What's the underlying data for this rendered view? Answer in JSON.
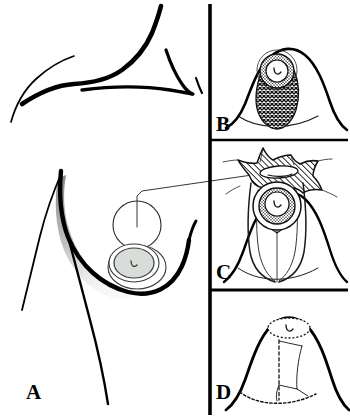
{
  "figure": {
    "kind": "medical-surgical-illustration",
    "background_color": "#ffffff",
    "ink_color": "#000000",
    "width_px": 350,
    "height_px": 419
  },
  "panels": [
    {
      "id": "A",
      "label": "A",
      "name": "panel-a-torso-overview",
      "description": "Anterior torso line drawing showing shoulder, neck, clavicle, sternal notch, breast contour with shading, tumor location circle and nipple-areola complex",
      "elements": [
        "shoulder-contour",
        "neck-contour",
        "clavicle-line",
        "sternal-notch",
        "breast-contour-shadow",
        "tumor-circle",
        "leader-line",
        "nipple-areola-complex"
      ]
    },
    {
      "id": "B",
      "label": "B",
      "name": "panel-b-resection-marking",
      "description": "Frontal breast mound with cross-hatched teardrop resection field extending from areola to inframammary fold",
      "elements": [
        "breast-mound-outline",
        "inframammary-fold",
        "crosshatch-resection-area",
        "stippled-areola-ring",
        "nipple-mark"
      ]
    },
    {
      "id": "C",
      "label": "C",
      "name": "panel-c-tissue-mobilization",
      "description": "Breast mound with diagonally hatched superior tissue flap, specimen lens, radiating mobilization lines and converging inferior pillars",
      "elements": [
        "breast-mound-outline",
        "inframammary-fold",
        "diagonal-hatch-flap",
        "specimen-lens",
        "radiating-lines",
        "stippled-areola-ring",
        "nipple-mark",
        "converging-pillar-lines"
      ]
    },
    {
      "id": "D",
      "label": "D",
      "name": "panel-d-final-closure",
      "description": "Final reconstructed breast with repositioned areola, dashed vertical scar and dotted inframammary fold suture line",
      "elements": [
        "breast-mound-outline",
        "dotted-areola-outline",
        "nipple-mark",
        "dashed-vertical-scar",
        "scar-branch-lines",
        "dotted-inframammary-suture"
      ]
    }
  ],
  "dividers": {
    "name": "panel-dividers",
    "vertical_x": 210,
    "horizontal_y": [
      140,
      290
    ],
    "stroke_color": "#000000"
  },
  "palette": {
    "ink": "#000000",
    "areola_fill": "#d9ddd9",
    "shadow_gray": "#8c8c8c",
    "shadow_light": "#bdbdbd",
    "white": "#ffffff",
    "thin_line": "#333333"
  }
}
